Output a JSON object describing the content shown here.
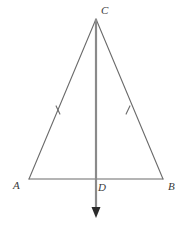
{
  "figure": {
    "type": "geometry-diagram",
    "canvas": {
      "width": 183,
      "height": 227,
      "background": "#ffffff"
    },
    "colors": {
      "stroke": "#6b6b6b",
      "ray_stroke": "#8a8a8a",
      "label": "#3a3a3a",
      "arrow_fill": "#2b2b2b"
    },
    "points": {
      "C": {
        "x": 96,
        "y": 19,
        "label": "C",
        "label_x": 101,
        "label_y": 5
      },
      "A": {
        "x": 29,
        "y": 179,
        "label": "A",
        "label_x": 13,
        "label_y": 180
      },
      "B": {
        "x": 163,
        "y": 179,
        "label": "B",
        "label_x": 168,
        "label_y": 181
      },
      "D": {
        "x": 96,
        "y": 179,
        "label": "D",
        "label_x": 98,
        "label_y": 182
      }
    },
    "segments": [
      {
        "name": "side-AC",
        "from": "A",
        "to": "C",
        "width": 1.1
      },
      {
        "name": "side-CB",
        "from": "C",
        "to": "B",
        "width": 1.1
      },
      {
        "name": "base-AB",
        "from": "A",
        "to": "B",
        "width": 1.1
      }
    ],
    "ray": {
      "name": "altitude-ray-CD",
      "from": "C",
      "through": "D",
      "tip_x": 96,
      "tip_y": 218,
      "width": 2.2,
      "arrowhead": {
        "half_width": 4.5,
        "length": 11
      }
    },
    "tick_marks": [
      {
        "name": "congruence-tick-AC",
        "x": 58,
        "y": 110,
        "angle_deg": 65,
        "length": 9
      },
      {
        "name": "congruence-tick-CB",
        "x": 128,
        "y": 110,
        "angle_deg": 115,
        "length": 9
      }
    ]
  }
}
